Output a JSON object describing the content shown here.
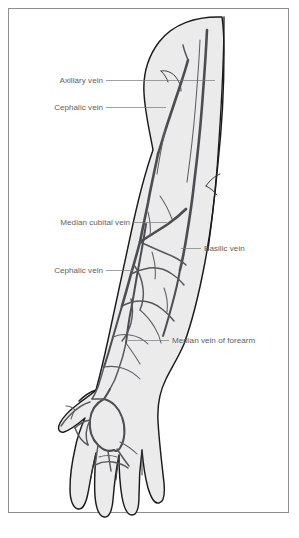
{
  "figure": {
    "view": "anterior",
    "frame_color": "#8d8f91",
    "background_color": "#ffffff",
    "skin_fill_color": "#ebebec",
    "outline_color": "#1b1b1d",
    "vein_color": "#4b4d51",
    "label_text_color": "#5e6063",
    "leader_line_color": "#76787b"
  },
  "labels": [
    {
      "id": "axillary-vein",
      "text": "Axillary vein",
      "side": "left",
      "text_x": 103,
      "text_y": 83,
      "leader": "M 106 80.5 L 215 80.5"
    },
    {
      "id": "cephalic-vein-upper",
      "text": "Cephalic vein",
      "side": "left",
      "text_x": 103,
      "text_y": 110,
      "leader": "M 106 107.5 L 166 107.5"
    },
    {
      "id": "median-cubital-vein",
      "text": "Median cubital vein",
      "side": "left",
      "text_x": 130,
      "text_y": 225,
      "leader": "M 133 222.5 L 167 222.5"
    },
    {
      "id": "basilic-vein",
      "text": "Basilic vein",
      "side": "right",
      "text_x": 204,
      "text_y": 251,
      "leader": "M 201 248.5 L 181 248.5"
    },
    {
      "id": "cephalic-vein-forearm",
      "text": "Cephalic vein",
      "side": "left",
      "text_x": 103,
      "text_y": 273,
      "leader": "M 106 270.5 L 133 270.5"
    },
    {
      "id": "median-vein-of-forearm",
      "text": "Median vein of forearm",
      "side": "right",
      "text_x": 172,
      "text_y": 343,
      "leader": "M 169 340.5 L 128 340.5"
    }
  ],
  "anatomy": {
    "regions": [
      "shoulder",
      "upper-arm",
      "elbow-cubital-fossa",
      "forearm",
      "wrist",
      "hand-dorsum",
      "thumb",
      "fingers"
    ],
    "named_veins": [
      "Axillary vein",
      "Cephalic vein",
      "Median cubital vein",
      "Basilic vein",
      "Median vein of forearm"
    ]
  }
}
